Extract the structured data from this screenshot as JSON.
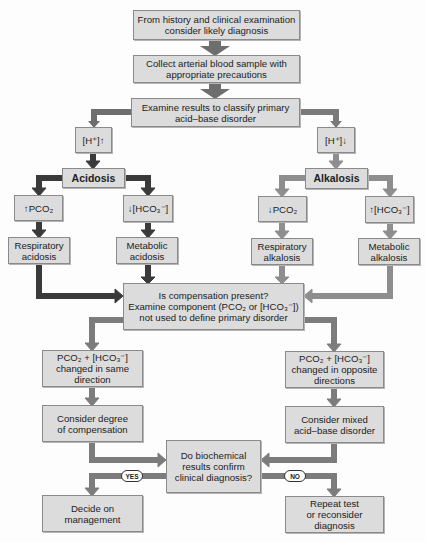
{
  "diagram": {
    "type": "flowchart",
    "colors": {
      "box_fill": "#dcdcdc",
      "box_border": "#8a8a8a",
      "arrow_main": "#6e6e6e",
      "arrow_acidosis": "#3a3a3a",
      "arrow_alkalosis": "#8e8e8e",
      "arrow_compensation": "#7c7c7c"
    },
    "nodes": {
      "start": "From history and clinical examination consider likely diagnosis",
      "collect": "Collect arterial blood sample with appropriate precautions",
      "examine": "Examine results to classify primary acid–base disorder",
      "h_up": "[H⁺]↑",
      "h_down": "[H⁺]↓",
      "acidosis": "Acidosis",
      "alkalosis": "Alkalosis",
      "pco2_up": "↑PCO₂",
      "hco3_down": "↓[HCO₃⁻]",
      "pco2_down": "↓PCO₂",
      "hco3_up": "↑[HCO₃⁻]",
      "resp_acidosis": "Respiratory acidosis",
      "metab_acidosis": "Metabolic acidosis",
      "resp_alkalosis": "Respiratory alkalosis",
      "metab_alkalosis": "Metabolic alkalosis",
      "compensation": "Is compensation present? Examine component (PCO₂ or [HCO₃⁻]) not used to define primary disorder",
      "same_direction": "PCO₂ + [HCO₃⁻] changed in same direction",
      "opposite_direction": "PCO₂ + [HCO₃⁻] changed in opposite directions",
      "degree": "Consider degree of compensation",
      "mixed": "Consider mixed acid–base disorder",
      "confirm": "Do biochemical results confirm clinical diagnosis?",
      "decide": "Decide on management",
      "repeat": "Repeat test or reconsider diagnosis"
    },
    "lines": {
      "start": [
        "From history and clinical examination",
        "consider likely diagnosis"
      ],
      "collect": [
        "Collect arterial blood sample with",
        "appropriate precautions"
      ],
      "examine": [
        "Examine results to classify primary",
        "acid–base disorder"
      ],
      "resp_acidosis": [
        "Respiratory",
        "acidosis"
      ],
      "metab_acidosis": [
        "Metabolic",
        "acidosis"
      ],
      "resp_alkalosis": [
        "Respiratory",
        "alkalosis"
      ],
      "metab_alkalosis": [
        "Metabolic",
        "alkalosis"
      ],
      "compensation": [
        "Is compensation present?",
        "Examine component (PCO₂ or [HCO₃⁻])",
        "not used to define primary disorder"
      ],
      "same_direction": [
        "PCO₂ + [HCO₃⁻]",
        "changed in same",
        "direction"
      ],
      "opposite_direction": [
        "PCO₂ + [HCO₃⁻]",
        "changed in opposite",
        "directions"
      ],
      "degree": [
        "Consider degree",
        "of compensation"
      ],
      "mixed": [
        "Consider mixed",
        "acid–base disorder"
      ],
      "confirm": [
        "Do biochemical",
        "results confirm",
        "clinical diagnosis?"
      ],
      "decide": [
        "Decide on",
        "management"
      ],
      "repeat": [
        "Repeat test",
        "or reconsider",
        "diagnosis"
      ]
    },
    "edge_labels": {
      "yes": "YES",
      "no": "NO"
    },
    "edges": [
      [
        "start",
        "collect"
      ],
      [
        "collect",
        "examine"
      ],
      [
        "examine",
        "h_up"
      ],
      [
        "examine",
        "h_down"
      ],
      [
        "h_up",
        "acidosis"
      ],
      [
        "h_down",
        "alkalosis"
      ],
      [
        "acidosis",
        "pco2_up"
      ],
      [
        "acidosis",
        "hco3_down"
      ],
      [
        "alkalosis",
        "pco2_down"
      ],
      [
        "alkalosis",
        "hco3_up"
      ],
      [
        "pco2_up",
        "resp_acidosis"
      ],
      [
        "hco3_down",
        "metab_acidosis"
      ],
      [
        "pco2_down",
        "resp_alkalosis"
      ],
      [
        "hco3_up",
        "metab_alkalosis"
      ],
      [
        "resp_acidosis",
        "compensation"
      ],
      [
        "metab_acidosis",
        "compensation"
      ],
      [
        "resp_alkalosis",
        "compensation"
      ],
      [
        "metab_alkalosis",
        "compensation"
      ],
      [
        "compensation",
        "same_direction"
      ],
      [
        "compensation",
        "opposite_direction"
      ],
      [
        "same_direction",
        "degree"
      ],
      [
        "opposite_direction",
        "mixed"
      ],
      [
        "degree",
        "confirm"
      ],
      [
        "mixed",
        "confirm"
      ],
      [
        "confirm",
        "decide",
        "YES"
      ],
      [
        "confirm",
        "repeat",
        "NO"
      ]
    ]
  }
}
